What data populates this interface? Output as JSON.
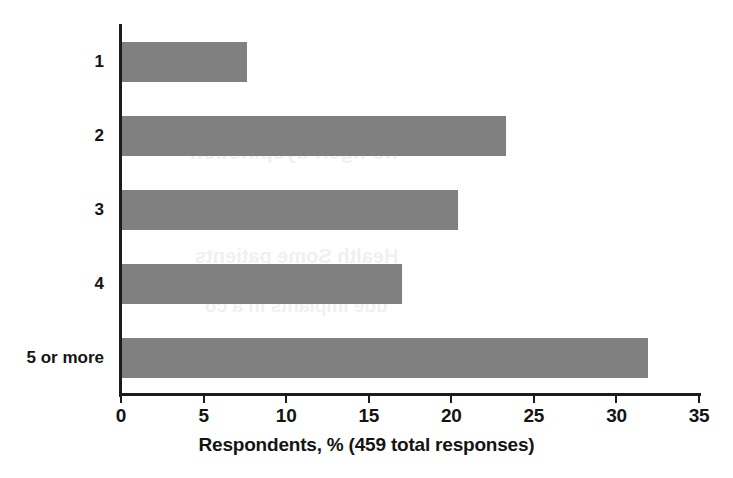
{
  "chart_data": {
    "type": "bar",
    "orientation": "horizontal",
    "title": "",
    "subtitle": "",
    "categories": [
      "1",
      "2",
      "3",
      "4",
      "5 or more"
    ],
    "values": [
      7.6,
      23.3,
      20.4,
      17.0,
      31.9
    ],
    "series": [
      {
        "name": "Respondents",
        "values": [
          7.6,
          23.3,
          20.4,
          17.0,
          31.9
        ]
      }
    ],
    "xlabel": "Respondents, % (459 total responses)",
    "ylabel": "",
    "xlim": [
      0,
      35
    ],
    "xticks": [
      0,
      5,
      10,
      15,
      20,
      25,
      30,
      35
    ],
    "xtick_labels": [
      "0",
      "5",
      "10",
      "15",
      "20",
      "25",
      "30",
      "35"
    ],
    "grid": false,
    "legend": false,
    "legend_position": "none",
    "total_responses": 459,
    "bar_color": "#808080",
    "axis_color": "#1c1c1c",
    "background_color": "#ffffff"
  },
  "axis": {
    "x_title": "Respondents, % (459 total responses)"
  },
  "ghost_text": {
    "line1": "no figeri dyspinotion",
    "line2": "Health Some patients",
    "line3": "ude implants in a co"
  }
}
